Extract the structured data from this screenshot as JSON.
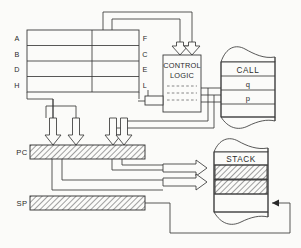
{
  "diagram": {
    "background_color": "#fbfbf9",
    "line_color": "#3a3a3a",
    "hatch_color": "#8a8a8a"
  },
  "register_file": {
    "name": "register-file",
    "left_labels": [
      "A",
      "B",
      "D",
      "H"
    ],
    "right_labels": [
      "F",
      "C",
      "E",
      "L"
    ],
    "rows": 4,
    "columns": 2
  },
  "control_logic": {
    "name": "control-logic",
    "line1": "CONTROL",
    "line2": "LOGIC",
    "dashed_rows": 3
  },
  "call_memory": {
    "name": "call-memory",
    "cells": [
      "CALL",
      "q",
      "p"
    ]
  },
  "stack_memory": {
    "name": "stack-memory",
    "title": "STACK",
    "filled_cells": 2,
    "empty_cells": 1
  },
  "registers": [
    {
      "name": "program-counter",
      "label": "PC",
      "filled": true
    },
    {
      "name": "stack-pointer",
      "label": "SP",
      "filled": true
    }
  ],
  "connections": {
    "into_control_logic": 2,
    "control_logic_to_call": 3,
    "into_program_counter": 2,
    "program_counter_to_stack": 2,
    "stack_pointer_to_stack": 1
  }
}
